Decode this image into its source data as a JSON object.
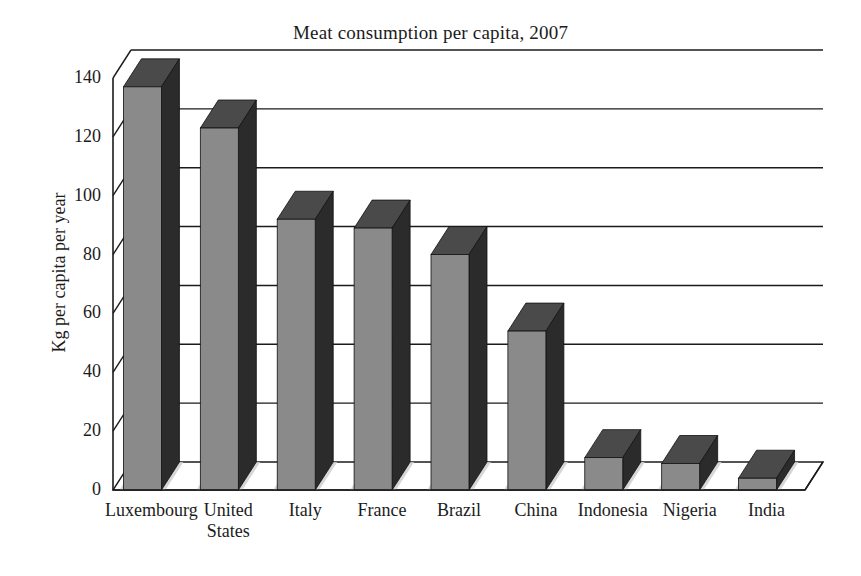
{
  "chart_data": {
    "type": "bar",
    "title": "Meat consumption per capita, 2007",
    "xlabel": "",
    "ylabel": "Kg per capita per year",
    "categories": [
      "Luxembourg",
      "United\nStates",
      "Italy",
      "France",
      "Brazil",
      "China",
      "Indonesia",
      "Nigeria",
      "India"
    ],
    "values": [
      137,
      123,
      92,
      89,
      80,
      54,
      11,
      9,
      4
    ],
    "ylim": [
      0,
      140
    ],
    "yticks": [
      0,
      20,
      40,
      60,
      80,
      100,
      120,
      140
    ],
    "ytick_labels": [
      "0",
      "20",
      "40",
      "60",
      "80",
      "100",
      "120",
      "140"
    ],
    "grid": true,
    "legend": false,
    "style": "3d-column",
    "colors": {
      "bar_front": "#8a8a8a",
      "bar_side": "#2b2b2b",
      "bar_top": "#4a4a4a",
      "floor": "#e2e2e2",
      "shadow": "#cfcfcf",
      "axis": "#1b1b1b",
      "grid": "#1b1b1b",
      "background": "#ffffff",
      "text": "#1b1b1b"
    }
  }
}
